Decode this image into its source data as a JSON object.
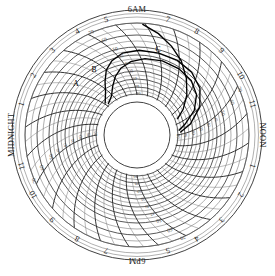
{
  "chart_data": {
    "type": "line",
    "title": "",
    "subtitle": "",
    "chart_style": "circular-chart-recorder",
    "xlabel": "",
    "ylabel": "",
    "grid": true,
    "legend_position": "inline-annotations",
    "center": {
      "x": 137,
      "y": 135
    },
    "outer_radius": 125,
    "hub_radius": 33,
    "grid_radius_inner": 40,
    "grid_radius_outer": 112,
    "angular_axis": {
      "name": "time-of-day",
      "period_hours": 24,
      "start_at_top": "6AM",
      "direction": "clockwise",
      "tick_labels": [
        {
          "label": "6AM",
          "hour": 6,
          "angle_deg": 0,
          "kind": "word"
        },
        {
          "label": "7",
          "hour": 7,
          "angle_deg": 15,
          "kind": "num"
        },
        {
          "label": "8",
          "hour": 8,
          "angle_deg": 30,
          "kind": "num"
        },
        {
          "label": "9",
          "hour": 9,
          "angle_deg": 45,
          "kind": "num"
        },
        {
          "label": "10",
          "hour": 10,
          "angle_deg": 60,
          "kind": "num"
        },
        {
          "label": "11",
          "hour": 11,
          "angle_deg": 75,
          "kind": "num"
        },
        {
          "label": "NOON",
          "hour": 12,
          "angle_deg": 90,
          "kind": "word"
        },
        {
          "label": "1",
          "hour": 13,
          "angle_deg": 105,
          "kind": "num"
        },
        {
          "label": "2",
          "hour": 14,
          "angle_deg": 120,
          "kind": "num"
        },
        {
          "label": "3",
          "hour": 15,
          "angle_deg": 135,
          "kind": "num"
        },
        {
          "label": "4",
          "hour": 16,
          "angle_deg": 150,
          "kind": "num"
        },
        {
          "label": "5",
          "hour": 17,
          "angle_deg": 165,
          "kind": "num"
        },
        {
          "label": "6PM",
          "hour": 18,
          "angle_deg": 180,
          "kind": "word"
        },
        {
          "label": "7",
          "hour": 19,
          "angle_deg": 195,
          "kind": "num"
        },
        {
          "label": "8",
          "hour": 20,
          "angle_deg": 210,
          "kind": "num"
        },
        {
          "label": "9",
          "hour": 21,
          "angle_deg": 225,
          "kind": "num"
        },
        {
          "label": "10",
          "hour": 22,
          "angle_deg": 240,
          "kind": "num"
        },
        {
          "label": "11",
          "hour": 23,
          "angle_deg": 255,
          "kind": "num"
        },
        {
          "label": "MIDNIGHT",
          "hour": 0,
          "angle_deg": 270,
          "kind": "word"
        },
        {
          "label": "1",
          "hour": 1,
          "angle_deg": 285,
          "kind": "num"
        },
        {
          "label": "2",
          "hour": 2,
          "angle_deg": 300,
          "kind": "num"
        },
        {
          "label": "3",
          "hour": 3,
          "angle_deg": 315,
          "kind": "num"
        },
        {
          "label": "4",
          "hour": 4,
          "angle_deg": 330,
          "kind": "num"
        },
        {
          "label": "5",
          "hour": 5,
          "angle_deg": 345,
          "kind": "num"
        }
      ]
    },
    "radial_axis": {
      "name": "value-scale",
      "direction": "increasing-outward",
      "range": [
        20,
        70
      ],
      "tick_values": [
        20,
        25,
        30,
        35,
        40,
        45,
        50,
        60,
        70
      ],
      "labeled_ticks": [
        {
          "value": 70,
          "radius": 112,
          "emphasis": "big"
        },
        {
          "value": 60,
          "radius": 100,
          "emphasis": "big"
        },
        {
          "value": 50,
          "radius": 88,
          "emphasis": "big"
        },
        {
          "value": 45,
          "radius": 80,
          "emphasis": "small"
        },
        {
          "value": 40,
          "radius": 72,
          "emphasis": "small"
        },
        {
          "value": 35,
          "radius": 64,
          "emphasis": "small"
        },
        {
          "value": 30,
          "radius": 56,
          "emphasis": "small"
        },
        {
          "value": 25,
          "radius": 48,
          "emphasis": "small"
        },
        {
          "value": 20,
          "radius": 41,
          "emphasis": "small"
        }
      ],
      "minor_arc_radii": [
        41,
        44.5,
        48,
        52,
        56,
        60,
        64,
        68,
        72,
        76,
        80,
        84,
        88,
        94,
        100,
        106,
        112
      ],
      "label_sectors_deg": [
        0,
        90,
        180,
        270
      ]
    },
    "traces": [
      {
        "name": "A",
        "label": "A",
        "label_pos": {
          "x": 76,
          "y": 84
        },
        "stroke": "#000000",
        "description": "lower pen trace rising from lower-left through mid-upper-left",
        "points": [
          {
            "hour": 3.2,
            "value": 21
          },
          {
            "hour": 3.9,
            "value": 24
          },
          {
            "hour": 4.5,
            "value": 29
          },
          {
            "hour": 5.1,
            "value": 34
          },
          {
            "hour": 5.7,
            "value": 38
          },
          {
            "hour": 6.4,
            "value": 41
          },
          {
            "hour": 7.2,
            "value": 43
          },
          {
            "hour": 8.1,
            "value": 44
          },
          {
            "hour": 9.0,
            "value": 44
          },
          {
            "hour": 9.8,
            "value": 43
          },
          {
            "hour": 10.4,
            "value": 40
          },
          {
            "hour": 10.9,
            "value": 34
          },
          {
            "hour": 11.3,
            "value": 26
          },
          {
            "hour": 11.6,
            "value": 21
          }
        ]
      },
      {
        "name": "B",
        "label": "B",
        "label_pos": {
          "x": 94,
          "y": 70
        },
        "stroke": "#000000",
        "description": "upper pen trace, slightly above and outside trace A",
        "points": [
          {
            "hour": 3.1,
            "value": 23
          },
          {
            "hour": 3.8,
            "value": 28
          },
          {
            "hour": 4.4,
            "value": 34
          },
          {
            "hour": 5.0,
            "value": 40
          },
          {
            "hour": 5.6,
            "value": 44
          },
          {
            "hour": 6.3,
            "value": 47
          },
          {
            "hour": 7.1,
            "value": 48
          },
          {
            "hour": 8.0,
            "value": 48
          },
          {
            "hour": 8.9,
            "value": 48
          },
          {
            "hour": 9.7,
            "value": 47
          },
          {
            "hour": 10.4,
            "value": 44
          },
          {
            "hour": 11.0,
            "value": 38
          },
          {
            "hour": 11.5,
            "value": 29
          },
          {
            "hour": 11.8,
            "value": 22
          }
        ]
      },
      {
        "name": "C",
        "label": "C",
        "label_pos": {
          "x": 158,
          "y": 50
        },
        "stroke": "#000000",
        "description": "steep trace descending from outer rim near hour 8 toward the hub",
        "points": [
          {
            "hour": 7.9,
            "value": 69
          },
          {
            "hour": 8.3,
            "value": 63
          },
          {
            "hour": 8.7,
            "value": 56
          },
          {
            "hour": 9.1,
            "value": 49
          },
          {
            "hour": 9.5,
            "value": 42
          },
          {
            "hour": 9.9,
            "value": 35
          },
          {
            "hour": 10.3,
            "value": 28
          },
          {
            "hour": 10.6,
            "value": 22
          }
        ]
      }
    ],
    "annotations": [
      {
        "text": "A",
        "x": 76,
        "y": 84
      },
      {
        "text": "B",
        "x": 94,
        "y": 70
      },
      {
        "text": "C",
        "x": 158,
        "y": 50
      }
    ]
  },
  "meta": {
    "chart_name": "circular-chart-recorder-disk"
  }
}
